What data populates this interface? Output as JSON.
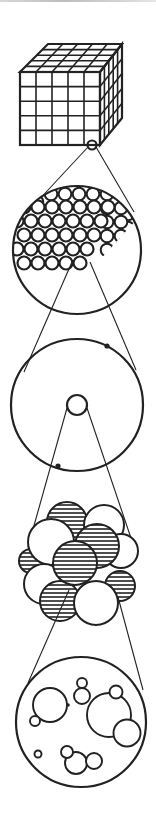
{
  "diagram": {
    "title": "",
    "colors": {
      "ink": "#222222",
      "background": "#ffffff"
    },
    "levels": [
      {
        "name": "crystal",
        "icon": "cube-lattice-icon",
        "grid": [
          5,
          5,
          5
        ]
      },
      {
        "name": "atomic-lattice",
        "icon": "atom-lattice-icon"
      },
      {
        "name": "atom",
        "icon": "atom-icon",
        "electrons": 2
      },
      {
        "name": "nucleus",
        "icon": "nucleus-icon",
        "protons_hatched": 6,
        "neutrons_white": 5
      },
      {
        "name": "nucleon",
        "icon": "nucleon-bubbles-icon"
      }
    ],
    "labels": []
  }
}
